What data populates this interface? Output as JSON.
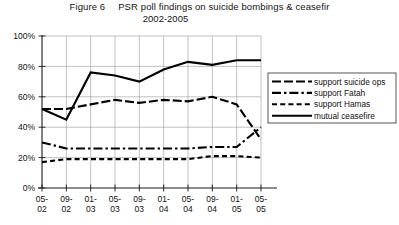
{
  "figure": {
    "label": "Figure 6",
    "title_line1": "PSR poll findings on suicide bombings & ceasefir",
    "title_line2": "2002-2005"
  },
  "chart_data": {
    "type": "line",
    "xlabel": "",
    "ylabel": "",
    "ylim": [
      0,
      100
    ],
    "ytick_labels": [
      "0%",
      "20%",
      "40%",
      "60%",
      "80%",
      "100%"
    ],
    "ytick_values": [
      0,
      20,
      40,
      60,
      80,
      100
    ],
    "grid": true,
    "legend_position": "right",
    "categories": [
      "05-02",
      "09-02",
      "01-03",
      "05-03",
      "09-03",
      "01-04",
      "05-04",
      "09-04",
      "01-05",
      "05-05"
    ],
    "x_labels_top": [
      "05-",
      "09-",
      "01-",
      "05-",
      "09-",
      "01-",
      "05-",
      "09-",
      "01-",
      "05-"
    ],
    "x_labels_bottom": [
      "02",
      "02",
      "03",
      "03",
      "03",
      "04",
      "04",
      "04",
      "05",
      "05"
    ],
    "series": [
      {
        "name": "support suicide ops",
        "style": "long-dash",
        "values": [
          52,
          52,
          55,
          58,
          56,
          58,
          57,
          60,
          55,
          32
        ]
      },
      {
        "name": "support Fatah",
        "style": "dash-dot",
        "values": [
          30,
          26,
          26,
          26,
          26,
          26,
          26,
          27,
          27,
          40
        ]
      },
      {
        "name": "support Hamas",
        "style": "dashed",
        "values": [
          17,
          19,
          19,
          19,
          19,
          19,
          19,
          21,
          21,
          20
        ]
      },
      {
        "name": "mutual ceasefire",
        "style": "solid",
        "values": [
          52,
          45,
          76,
          74,
          70,
          78,
          83,
          81,
          84,
          84
        ]
      }
    ]
  },
  "legend": {
    "items": [
      {
        "label": "support suicide ops",
        "style": "long-dash"
      },
      {
        "label": "support Fatah",
        "style": "dash-dot"
      },
      {
        "label": "support Hamas",
        "style": "dashed"
      },
      {
        "label": "mutual ceasefire",
        "style": "solid"
      }
    ]
  }
}
